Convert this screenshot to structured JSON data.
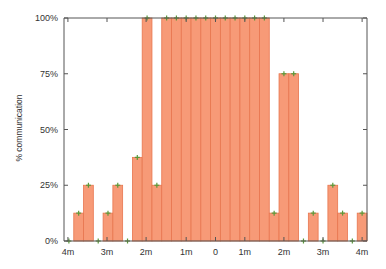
{
  "chart_data": {
    "type": "bar",
    "title": "",
    "xlabel": "",
    "ylabel": "% communication",
    "ylim": [
      0,
      100
    ],
    "yticks": [
      "0%",
      "25%",
      "50%",
      "75%",
      "100%"
    ],
    "ytick_values": [
      0,
      25,
      50,
      75,
      100
    ],
    "xtick_labels": [
      "4m",
      "3m",
      "2m",
      "1m",
      "0",
      "1m",
      "2m",
      "3m",
      "4m"
    ],
    "xtick_positions_bins": [
      0.4,
      4.4,
      8.4,
      12.5,
      15.5,
      18.5,
      22.5,
      26.5,
      30.5
    ],
    "grid": false,
    "legend": null,
    "bar_color": "#f79a77",
    "bar_edge_color": "#e8764f",
    "marker_color": "#5a9a3a",
    "axis_color": "#555555",
    "bins": 31,
    "values": [
      0,
      12.5,
      25,
      0,
      12.5,
      25,
      0,
      37.5,
      100,
      25,
      100,
      100,
      100,
      100,
      100,
      100,
      100,
      100,
      100,
      100,
      100,
      12.5,
      75,
      75,
      0,
      12.5,
      0,
      25,
      12.5,
      0,
      12.5
    ]
  }
}
